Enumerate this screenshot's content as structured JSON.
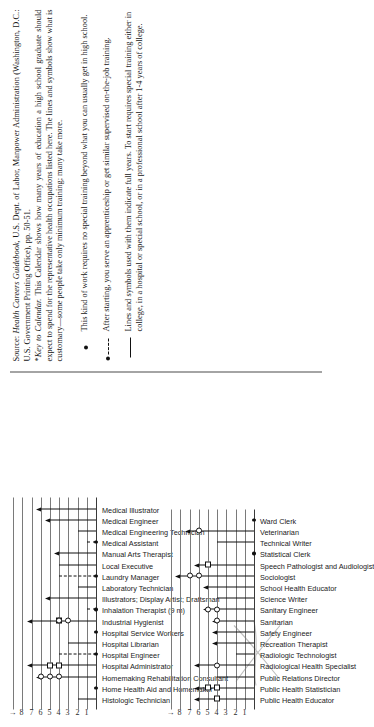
{
  "document": {
    "type": "chart-figure-page",
    "orientation_note": "page content printed rotated 90 degrees"
  },
  "axis": {
    "ticks": [
      "1",
      "2",
      "3",
      "4",
      "5",
      "6",
      "7",
      "8"
    ],
    "arrow_glyph": "→",
    "label": "Years of education and training"
  },
  "source": {
    "prefix": "Source:",
    "title": "Health Careers Guidebook,",
    "rest": "U.S. Dept. of Labor, Manpower Administration (Washington, D.C.: U.S. Government Printing Office), pp. 50-51."
  },
  "footnote": {
    "star": "*",
    "title": "Key to Calendar.",
    "text": "This Calendar shows how many years of education a high school graduate should expect to spend for the representative health occupations listed here. The lines and symbols show what is customary—some people take only minimum training; many take more."
  },
  "legend": [
    {
      "key": "filled-dot",
      "text": "This kind of work requires no special training beyond what you can usually get in high school."
    },
    {
      "key": "dot-dashed-line",
      "text": "After starting, you serve an apprenticeship or get similar supervised on-the-job training."
    },
    {
      "key": "solid-line",
      "text": "Lines and symbols used with them indicate full years. To start requires special training either in college, in a hospital or special school, or in a professional school after 1-4 years of college."
    }
  ],
  "chart_data": {
    "type": "bar",
    "xlabel": "Years",
    "ylabel": "",
    "xlim": [
      0,
      9
    ],
    "grid": true,
    "legend_position": "below",
    "columns": [
      {
        "name": "column-left",
        "categories": [
          "Histologic Technician",
          "Home Health Aid and Homemaker",
          "Homemaking Rehabilitation Consultant",
          "Hospital Administrator",
          "Hospital Engineer",
          "Hospital Librarian",
          "Hospital Service Workers",
          "Industrial Hygienist",
          "Inhalation Therapist (9 m)",
          "Illustrators; Display Artist; Draftsman",
          "Laboratory Technician",
          "Laundry Manager",
          "Local Executive",
          "Manual Arts Therapist",
          "Medical Assistant",
          "Medical Engineering Technician",
          "Medical Engineer",
          "Medical Illustrator"
        ],
        "values": [
          2,
          0,
          6,
          7,
          4,
          3,
          0,
          7,
          1,
          2,
          2,
          4,
          4,
          4,
          1,
          2,
          5,
          6
        ],
        "markers": [
          {
            "row": 0,
            "type": "line",
            "to": 2
          },
          {
            "row": 1,
            "type": "dot",
            "at": 0
          },
          {
            "row": 2,
            "type": "arrow",
            "to": 6,
            "circles": [
              4,
              5,
              6
            ]
          },
          {
            "row": 3,
            "type": "arrow",
            "to": 7,
            "squares": [
              4,
              5
            ]
          },
          {
            "row": 4,
            "type": "dot-dash",
            "to": 4
          },
          {
            "row": 5,
            "type": "line",
            "to": 3
          },
          {
            "row": 6,
            "type": "dot",
            "at": 0
          },
          {
            "row": 7,
            "type": "arrow",
            "to": 7,
            "squares": [
              4
            ],
            "circles": [
              3,
              4
            ]
          },
          {
            "row": 8,
            "type": "dot-dash",
            "to": 1
          },
          {
            "row": 9,
            "type": "arrow",
            "to": 5
          },
          {
            "row": 10,
            "type": "line",
            "to": 2
          },
          {
            "row": 11,
            "type": "dot-dash",
            "to": 4
          },
          {
            "row": 12,
            "type": "line",
            "to": 4
          },
          {
            "row": 13,
            "type": "arrow",
            "to": 4
          },
          {
            "row": 14,
            "type": "dot-dash",
            "to": 1
          },
          {
            "row": 15,
            "type": "line",
            "to": 2
          },
          {
            "row": 16,
            "type": "arrow",
            "to": 5
          },
          {
            "row": 17,
            "type": "arrow",
            "to": 6
          }
        ]
      },
      {
        "name": "column-right",
        "categories": [
          "Public Health Educator",
          "Public Health Statistician",
          "Public Relations Director",
          "Radiological Health Specialist",
          "Radiologic Technologist",
          "Recreation Therapist",
          "Safety Engineer",
          "Sanitarian",
          "Sanitary Engineer",
          "Science Writer",
          "School Health Educator",
          "Sociologist",
          "Speech Pathologist and Audiologist",
          "Statistical Clerk",
          "Technical Writer",
          "Veterinarian",
          "Ward Clerk"
        ],
        "values": [
          6,
          6,
          4,
          6,
          2,
          4,
          4,
          4,
          5,
          4,
          5,
          8,
          6,
          1,
          4,
          7,
          0
        ],
        "markers": [
          {
            "row": 0,
            "type": "arrow",
            "to": 6,
            "squares": [
              4
            ]
          },
          {
            "row": 1,
            "type": "arrow",
            "to": 6,
            "squares": [
              4,
              5
            ]
          },
          {
            "row": 2,
            "type": "line",
            "to": 4
          },
          {
            "row": 3,
            "type": "arrow",
            "to": 6,
            "circles": [
              4
            ]
          },
          {
            "row": 4,
            "type": "line",
            "to": 2
          },
          {
            "row": 5,
            "type": "arrow",
            "to": 4
          },
          {
            "row": 6,
            "type": "arrow",
            "to": 4
          },
          {
            "row": 7,
            "type": "arrow",
            "to": 4,
            "circles": [
              4
            ]
          },
          {
            "row": 8,
            "type": "arrow",
            "to": 5,
            "circles": [
              4,
              5
            ]
          },
          {
            "row": 9,
            "type": "line",
            "to": 4
          },
          {
            "row": 10,
            "type": "arrow",
            "to": 5
          },
          {
            "row": 11,
            "type": "arrow",
            "to": 8,
            "circles": [
              6,
              7
            ]
          },
          {
            "row": 12,
            "type": "arrow",
            "to": 6,
            "squares": [
              5
            ]
          },
          {
            "row": 13,
            "type": "dot",
            "at": 0
          },
          {
            "row": 14,
            "type": "line",
            "to": 4
          },
          {
            "row": 15,
            "type": "arrow",
            "to": 7,
            "circles": [
              6
            ]
          },
          {
            "row": 16,
            "type": "dot",
            "at": 0
          }
        ]
      }
    ]
  }
}
